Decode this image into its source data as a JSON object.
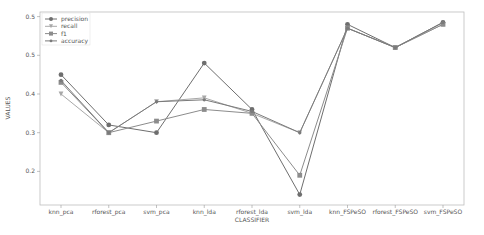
{
  "chart_data": {
    "type": "line",
    "title": "",
    "xlabel": "CLASSIFIER",
    "ylabel": "VALUES",
    "ylim": [
      0.115,
      0.61
    ],
    "yticks": [
      0.2,
      0.3,
      0.4,
      0.5,
      0.6
    ],
    "ytick_labels": [
      "0.2",
      "0.3",
      "0.4",
      "0.5",
      "0.5"
    ],
    "grid": false,
    "legend_position": "upper left",
    "categories": [
      "knn_pca",
      "rforest_pca",
      "svm_pca",
      "knn_lda",
      "rforest_lda",
      "svm_lda",
      "knn_FSPeSO",
      "rforest_FSPeSO",
      "svm_FSPeSO"
    ],
    "series": [
      {
        "name": "precision",
        "marker": "circle",
        "color": "#6e6e6e",
        "values": [
          0.45,
          0.32,
          0.3,
          0.48,
          0.36,
          0.14,
          0.58,
          0.52,
          0.585
        ]
      },
      {
        "name": "recall",
        "marker": "triangle-down",
        "color": "#a8a8a8",
        "values": [
          0.4,
          0.3,
          0.38,
          0.39,
          0.35,
          0.3,
          0.57,
          0.52,
          0.58
        ]
      },
      {
        "name": "f1",
        "marker": "square",
        "color": "#8c8c8c",
        "values": [
          0.43,
          0.3,
          0.33,
          0.36,
          0.35,
          0.19,
          0.57,
          0.52,
          0.58
        ]
      },
      {
        "name": "accuracy",
        "marker": "star",
        "color": "#7a7a7a",
        "values": [
          0.435,
          0.3,
          0.38,
          0.385,
          0.355,
          0.3,
          0.57,
          0.52,
          0.585
        ]
      }
    ]
  }
}
